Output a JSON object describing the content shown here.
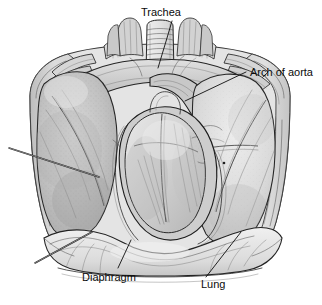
{
  "figure": {
    "kind": "anatomical-illustration",
    "style": "greyscale pen-and-ink medical drawing",
    "background_color": "#ffffff",
    "width": 322,
    "height": 305
  },
  "labels": [
    {
      "id": "trachea",
      "text": "Trachea",
      "text_x": 141,
      "text_y": 16,
      "anchor": "start",
      "leader": "M172,21 L167,38 L158,68"
    },
    {
      "id": "arch-of-aorta",
      "text": "Arch of aorta",
      "text_x": 250,
      "text_y": 76,
      "anchor": "start",
      "leader": "M246,72 L185,101"
    },
    {
      "id": "diaphragm",
      "text": "Diaphragm",
      "text_x": 82,
      "text_y": 281,
      "anchor": "start",
      "leader": "M118,268 L131,240"
    },
    {
      "id": "lung",
      "text": "Lung",
      "text_x": 201,
      "text_y": 288,
      "anchor": "start",
      "leader": "M206,277 L241,232"
    }
  ],
  "pointers": [
    {
      "id": "upper-left-pointer",
      "note": "unlabeled leader line pointing to left lung / chest wall",
      "path": "M9,148 L99,177"
    },
    {
      "id": "lower-left-pointer",
      "note": "unlabeled leader line pointing to left costodiaphragmatic recess",
      "path": "M35,263 L92,232"
    }
  ],
  "palette": {
    "ink": "#2b2b2b",
    "ink_dark": "#161616",
    "ink_thin": "#4a4a4a",
    "label_text": "#0b0b0b",
    "background": "#ffffff",
    "lung_left_fill": "#c5c5c5",
    "lung_right_fill": "#dcdcdc",
    "heart_fill": "#d4d4d4",
    "chest_wall_fill": "#d9d9d9",
    "diaphragm_fill": "#e6e6e6",
    "vessel_fill": "#cacaca",
    "trachea_fill": "#e3e3e3"
  },
  "structures": [
    {
      "id": "trachea",
      "name": "Trachea"
    },
    {
      "id": "arch-of-aorta",
      "name": "Arch of aorta"
    },
    {
      "id": "lung-right-of-image",
      "name": "Lung"
    },
    {
      "id": "lung-left-of-image",
      "name": "Lung"
    },
    {
      "id": "heart-pericardium",
      "name": "Heart in pericardium"
    },
    {
      "id": "diaphragm",
      "name": "Diaphragm"
    },
    {
      "id": "chest-wall",
      "name": "Chest wall and ribs"
    },
    {
      "id": "clavicle-cut-ends",
      "name": "Cut ends of clavicle and first rib"
    },
    {
      "id": "great-vessels",
      "name": "Great vessels of superior mediastinum"
    }
  ]
}
